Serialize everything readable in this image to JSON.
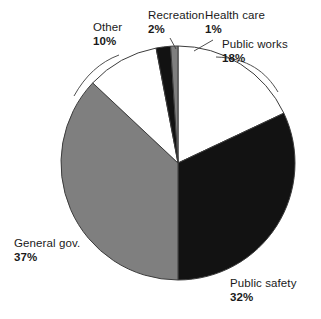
{
  "chart_data": {
    "type": "pie",
    "title": "",
    "subtitle": "",
    "xlabel": "",
    "ylabel": "",
    "legend_position": "none",
    "grid": false,
    "units": "%",
    "start_angle_deg": 0,
    "direction": "clockwise",
    "categories": [
      "Public works",
      "Public safety",
      "General gov.",
      "Other",
      "Recreation",
      "Health care"
    ],
    "values": [
      18,
      32,
      37,
      10,
      2,
      1
    ],
    "value_labels": [
      "18%",
      "32%",
      "37%",
      "10%",
      "2%",
      "1%"
    ],
    "colors": [
      "#ffffff",
      "#121212",
      "#7f7f7f",
      "#ffffff",
      "#121212",
      "#7f7f7f"
    ],
    "slices": [
      {
        "label": "Public works",
        "value": 18,
        "value_label": "18%",
        "color": "#ffffff",
        "label_x": 222,
        "label_y": 38,
        "align": "left",
        "leader": true
      },
      {
        "label": "Public safety",
        "value": 32,
        "value_label": "32%",
        "color": "#121212",
        "label_x": 230,
        "label_y": 277,
        "align": "left",
        "leader": false
      },
      {
        "label": "General gov.",
        "value": 37,
        "value_label": "37%",
        "color": "#7f7f7f",
        "label_x": 14,
        "label_y": 237,
        "align": "left",
        "leader": false
      },
      {
        "label": "Other",
        "value": 10,
        "value_label": "10%",
        "color": "#ffffff",
        "label_x": 93,
        "label_y": 21,
        "align": "left",
        "leader": true
      },
      {
        "label": "Recreation",
        "value": 2,
        "value_label": "2%",
        "color": "#121212",
        "label_x": 148,
        "label_y": 9,
        "align": "left",
        "leader": true
      },
      {
        "label": "Health care",
        "value": 1,
        "value_label": "1%",
        "color": "#7f7f7f",
        "label_x": 205,
        "label_y": 9,
        "align": "left",
        "leader": true
      }
    ],
    "geometry": {
      "center_x": 178,
      "center_y": 163,
      "radius": 117,
      "outline_color": "#3c3c3c",
      "outline_width": 1
    }
  }
}
